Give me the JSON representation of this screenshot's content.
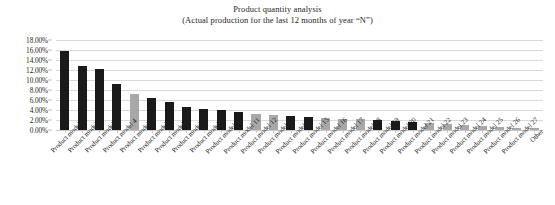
{
  "chart_data": {
    "type": "bar",
    "title": "Product quantity analysis",
    "subtitle": "(Actual production for the last 12 months of year “N”)",
    "xlabel": "",
    "ylabel": "",
    "ylim": [
      0,
      18
    ],
    "ytick_labels": [
      "18.00%",
      "16.00%",
      "14.00%",
      "12.00%",
      "10.00%",
      "8.00%",
      "6.00%",
      "4.00%",
      "2.00%",
      "0.00%"
    ],
    "ytick_values": [
      18,
      16,
      14,
      12,
      10,
      8,
      6,
      4,
      2,
      0
    ],
    "grid": true,
    "legend": "none",
    "value_suffix": "%",
    "categories": [
      "Product model 1",
      "Product model 2",
      "Product model 3",
      "Product model 4",
      "Product model 5",
      "Product model 6",
      "Product model 7",
      "Product model 8",
      "Product model 9",
      "Product model 10",
      "Product model 11",
      "Product model 12",
      "Product model 13",
      "Product model 14",
      "Product model 15",
      "Product model 16",
      "Product model 17",
      "Product model 18",
      "Product model 19",
      "Product model 20",
      "Product model 21",
      "Product model 22",
      "Product model 23",
      "Product model 24",
      "Product model 25",
      "Product model 26",
      "Product model 27",
      "Other"
    ],
    "values": [
      15.8,
      12.9,
      12.2,
      9.2,
      7.3,
      6.4,
      5.6,
      4.6,
      4.3,
      4.0,
      3.6,
      3.3,
      3.1,
      2.9,
      2.6,
      2.4,
      2.3,
      2.2,
      2.0,
      1.9,
      1.7,
      1.4,
      1.2,
      1.0,
      0.9,
      0.7,
      0.5,
      0.4
    ],
    "bar_colors": [
      "#1a1a1a",
      "#1a1a1a",
      "#1a1a1a",
      "#1a1a1a",
      "#a8a8a8",
      "#1a1a1a",
      "#1a1a1a",
      "#1a1a1a",
      "#1a1a1a",
      "#1a1a1a",
      "#1a1a1a",
      "#a8a8a8",
      "#a8a8a8",
      "#1a1a1a",
      "#1a1a1a",
      "#a8a8a8",
      "#a8a8a8",
      "#a8a8a8",
      "#1a1a1a",
      "#1a1a1a",
      "#1a1a1a",
      "#a8a8a8",
      "#a8a8a8",
      "#a8a8a8",
      "#a8a8a8",
      "#a8a8a8",
      "#a8a8a8",
      "#a8a8a8"
    ],
    "colors": {
      "bar_dark": "#1a1a1a",
      "bar_light": "#a8a8a8",
      "gridline": "#d9d9d9",
      "text": "#231f20",
      "background": "#ffffff"
    }
  }
}
